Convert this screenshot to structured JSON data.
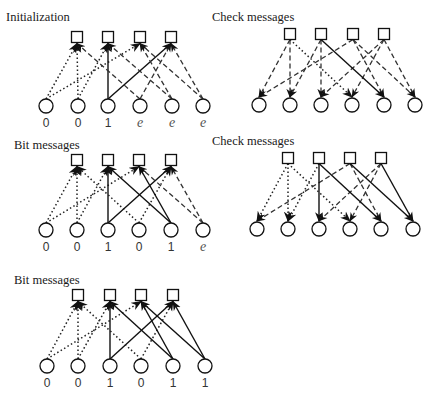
{
  "diagram": {
    "graph": {
      "check_nodes": 4,
      "bit_nodes": 6,
      "edges": [
        [
          0,
          0
        ],
        [
          0,
          2
        ],
        [
          1,
          0
        ],
        [
          1,
          1
        ],
        [
          2,
          1
        ],
        [
          2,
          3
        ],
        [
          3,
          0
        ],
        [
          3,
          3
        ],
        [
          4,
          1
        ],
        [
          4,
          2
        ],
        [
          5,
          2
        ],
        [
          5,
          3
        ]
      ]
    },
    "panels": [
      {
        "id": "p1",
        "title": "Initialization",
        "direction": "bit-to-check",
        "title_pos": [
          6,
          21
        ],
        "checks_x": [
          77,
          108,
          140,
          171
        ],
        "check_y": 37,
        "bits_x": [
          46,
          78,
          108,
          140,
          172,
          203
        ],
        "bit_y": 106,
        "label_y": 127,
        "bit_labels": [
          "0",
          "0",
          "1",
          "e",
          "e",
          "e"
        ],
        "edge_styles": {
          "0-0": "dotted",
          "0-2": "dotted",
          "1-0": "dotted",
          "1-1": "dotted",
          "2-1": "solid",
          "2-3": "solid",
          "3-0": "dashed",
          "3-3": "dashed",
          "4-1": "dashed",
          "4-2": "dashed",
          "5-2": "dashed",
          "5-3": "dashed"
        }
      },
      {
        "id": "p2",
        "title": "Check messages",
        "direction": "check-to-bit",
        "title_pos": [
          212,
          21
        ],
        "checks_x": [
          290,
          321,
          353,
          384
        ],
        "check_y": 34,
        "bits_x": [
          259,
          290,
          321,
          352,
          384,
          415
        ],
        "bit_y": 105,
        "label_y": null,
        "bit_labels": [],
        "edge_styles": {
          "0-0": "dashed",
          "0-2": "dashed",
          "1-0": "dashed",
          "1-1": "dashed",
          "2-1": "dashed",
          "2-3": "dashed",
          "3-0": "dotted",
          "3-3": "dashed",
          "4-1": "solid",
          "4-2": "dashed",
          "5-2": "dashed",
          "5-3": "dashed"
        }
      },
      {
        "id": "p3",
        "title": "Bit messages",
        "direction": "bit-to-check",
        "title_pos": [
          14,
          149
        ],
        "checks_x": [
          77,
          108,
          139,
          171
        ],
        "check_y": 160,
        "bits_x": [
          46,
          77,
          108,
          139,
          171,
          203
        ],
        "bit_y": 230,
        "label_y": 251,
        "bit_labels": [
          "0",
          "0",
          "1",
          "0",
          "1",
          "e"
        ],
        "edge_styles": {
          "0-0": "dotted",
          "0-2": "dotted",
          "1-0": "dotted",
          "1-1": "dotted",
          "2-1": "solid",
          "2-3": "solid",
          "3-0": "dotted",
          "3-3": "dotted",
          "4-1": "solid",
          "4-2": "solid",
          "5-2": "dashed",
          "5-3": "dashed"
        }
      },
      {
        "id": "p4",
        "title": "Check messages",
        "direction": "check-to-bit",
        "title_pos": [
          212,
          145
        ],
        "checks_x": [
          288,
          319,
          350,
          381
        ],
        "check_y": 158,
        "bits_x": [
          257,
          288,
          319,
          350,
          381,
          413
        ],
        "bit_y": 229,
        "label_y": null,
        "bit_labels": [],
        "edge_styles": {
          "0-0": "dotted",
          "0-2": "dashed",
          "1-0": "dotted",
          "1-1": "dotted",
          "2-1": "solid",
          "2-3": "dashed",
          "3-0": "dotted",
          "3-3": "dashed",
          "4-1": "solid",
          "4-2": "dashed",
          "5-2": "solid",
          "5-3": "solid"
        }
      },
      {
        "id": "p5",
        "title": "Bit messages",
        "direction": "bit-to-check",
        "title_pos": [
          14,
          284
        ],
        "checks_x": [
          78,
          110,
          141,
          173
        ],
        "check_y": 295,
        "bits_x": [
          47,
          78,
          110,
          141,
          173,
          205
        ],
        "bit_y": 366,
        "label_y": 387,
        "bit_labels": [
          "0",
          "0",
          "1",
          "0",
          "1",
          "1"
        ],
        "edge_styles": {
          "0-0": "dotted",
          "0-2": "dotted",
          "1-0": "dotted",
          "1-1": "dotted",
          "2-1": "solid",
          "2-3": "solid",
          "3-0": "dotted",
          "3-3": "dotted",
          "4-1": "solid",
          "4-2": "solid",
          "5-2": "solid",
          "5-3": "solid"
        }
      }
    ]
  }
}
